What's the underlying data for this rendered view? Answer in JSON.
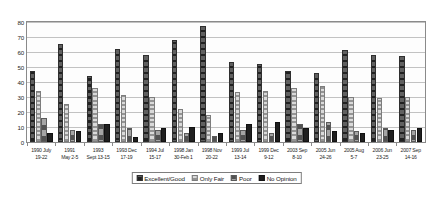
{
  "chart_data": {
    "type": "bar",
    "title": "",
    "subtitle": "",
    "xlabel": "",
    "ylabel": "",
    "ylim": [
      0,
      80
    ],
    "yticks": [
      0,
      10,
      20,
      30,
      40,
      50,
      60,
      70,
      80
    ],
    "grid": true,
    "legend_position": "bottom",
    "categories": [
      "1990 July 19-22",
      "1991 May 2-5",
      "1993 Sept 13-15",
      "1993 Dec 17-19",
      "1994 Jul 15-17",
      "1998 Jan 30-Feb 1",
      "1998 Nov 20-22",
      "1999 Jul 13-14",
      "1999 Dec 9-12",
      "2003 Sep 8-10",
      "2005 Jun 24-26",
      "2005 Aug 5-7",
      "2006 Jun 23-25",
      "2007 Sep 14-16"
    ],
    "category_lines": [
      [
        "1990 July",
        "19-22"
      ],
      [
        "1991",
        "May 2-5"
      ],
      [
        "1993",
        "Sept 13-15"
      ],
      [
        "1993 Dec",
        "17-19"
      ],
      [
        "1994 Jul",
        "15-17"
      ],
      [
        "1998 Jan",
        "30-Feb 1"
      ],
      [
        "1998 Nov",
        "20-22"
      ],
      [
        "1999 Jul",
        "13-14"
      ],
      [
        "1999 Dec",
        "9-12"
      ],
      [
        "2003 Sep",
        "8-10"
      ],
      [
        "2005 Jun",
        "24-26"
      ],
      [
        "2005 Aug",
        "5-7"
      ],
      [
        "2006 Jun",
        "23-25"
      ],
      [
        "2007 Sep",
        "14-16"
      ]
    ],
    "series": [
      {
        "name": "Excellent/Good",
        "color": "#4a4a4a",
        "values": [
          46,
          64,
          43,
          61,
          57,
          67,
          76,
          52,
          51,
          46,
          45,
          60,
          57,
          56
        ]
      },
      {
        "name": "Only Fair",
        "color": "#b4b4b4",
        "values": [
          33,
          24,
          35,
          30,
          29,
          21,
          17,
          32,
          33,
          35,
          36,
          29,
          28,
          29
        ]
      },
      {
        "name": "Poor",
        "color": "#7e7e7e",
        "values": [
          15,
          7,
          11,
          8,
          7,
          5,
          3,
          7,
          5,
          11,
          12,
          6,
          8,
          7
        ]
      },
      {
        "name": "No Opinion",
        "color": "#1f1f1f",
        "values": [
          5,
          6,
          11,
          2,
          8,
          9,
          5,
          11,
          12,
          8,
          6,
          5,
          7,
          8
        ]
      }
    ]
  },
  "legend": {
    "items": [
      {
        "label": "Excellent/Good"
      },
      {
        "label": "Only Fair"
      },
      {
        "label": "Poor"
      },
      {
        "label": "No Opinion"
      }
    ]
  }
}
